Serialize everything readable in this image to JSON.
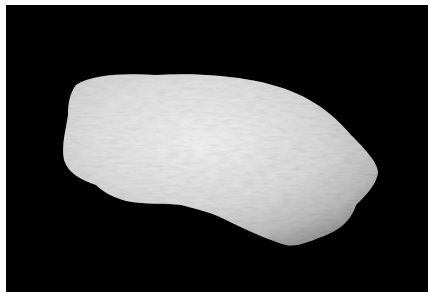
{
  "image": {
    "subject": "white mineral specimen (rock) on black background",
    "alt": "Photograph of a pale white, fibrous-textured rock specimen against a black background",
    "background_color": "#000000",
    "subject_color": "#e6e6e6"
  }
}
